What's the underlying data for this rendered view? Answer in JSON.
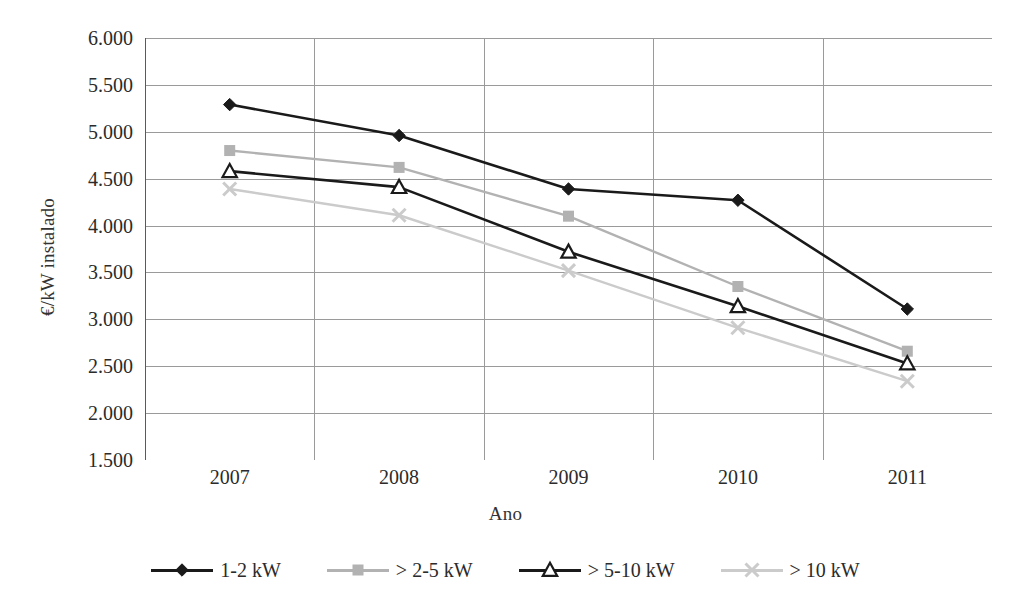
{
  "chart_data": {
    "type": "line",
    "title": "",
    "xlabel": "Ano",
    "ylabel": "€/kW instalado",
    "categories": [
      "2007",
      "2008",
      "2009",
      "2010",
      "2011"
    ],
    "ylim": [
      1500,
      6000
    ],
    "ytick_step": 500,
    "ytick_labels": [
      "6.000",
      "5.500",
      "5.000",
      "4.500",
      "4.000",
      "3.500",
      "3.000",
      "2.500",
      "2.000",
      "1.500"
    ],
    "ytick_values": [
      6000,
      5500,
      5000,
      4500,
      4000,
      3500,
      3000,
      2500,
      2000,
      1500
    ],
    "grid": {
      "horizontal": true,
      "vertical": true
    },
    "legend_position": "bottom",
    "series": [
      {
        "name": "1-2 kW",
        "marker": "diamond",
        "color": "#1a1a1a",
        "values": [
          5290,
          4960,
          4390,
          4270,
          3110
        ]
      },
      {
        "name": "> 2-5 kW",
        "marker": "square",
        "color": "#b2b2b2",
        "values": [
          4800,
          4620,
          4100,
          3350,
          2660
        ]
      },
      {
        "name": "> 5-10 kW",
        "marker": "triangle-open",
        "color": "#1a1a1a",
        "values": [
          4580,
          4410,
          3720,
          3140,
          2530
        ]
      },
      {
        "name": "> 10 kW",
        "marker": "x",
        "color": "#cbcbcb",
        "values": [
          4390,
          4110,
          3520,
          2910,
          2340
        ]
      }
    ]
  },
  "legend": {
    "items": [
      {
        "label": "1-2 kW"
      },
      {
        "label": "> 2-5 kW"
      },
      {
        "label": "> 5-10 kW"
      },
      {
        "label": "> 10 kW"
      }
    ]
  },
  "colors": {
    "axis": "#7a7a7a",
    "grid": "#9a9a9a",
    "text": "#2b2b2b",
    "background": "#ffffff"
  }
}
